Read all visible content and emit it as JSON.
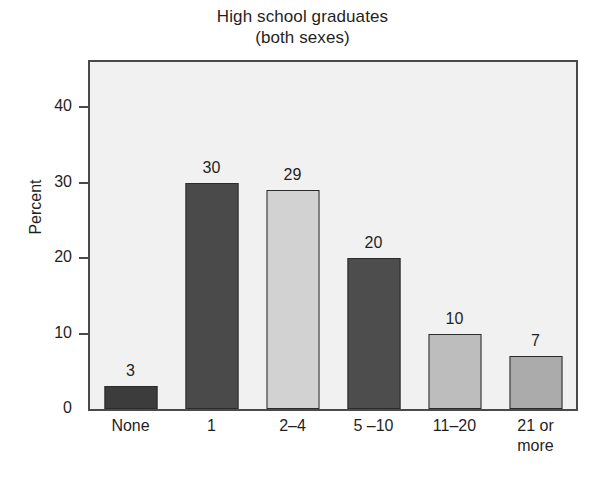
{
  "chart_data": {
    "type": "bar",
    "title": "High school graduates",
    "subtitle": "(both sexes)",
    "title_lines": [
      "High school graduates",
      "(both sexes)"
    ],
    "xlabel": "",
    "ylabel": "Percent",
    "categories": [
      "None",
      "1",
      "2–4",
      "5 –10",
      "11–20",
      "21 or\nmore"
    ],
    "category_lines": [
      [
        "None"
      ],
      [
        "1"
      ],
      [
        "2–4"
      ],
      [
        "5 –10"
      ],
      [
        "11–20"
      ],
      [
        "21 or",
        "more"
      ]
    ],
    "values": [
      3,
      30,
      29,
      20,
      10,
      7
    ],
    "value_labels": [
      "3",
      "30",
      "29",
      "20",
      "10",
      "7"
    ],
    "bar_colors": [
      "#3c3c3c",
      "#4a4a4a",
      "#d2d2d2",
      "#4d4d4d",
      "#bdbdbd",
      "#ababab"
    ],
    "bar_border_color": "#2b2b2b",
    "ylim": [
      0,
      46
    ],
    "yticks": [
      0,
      10,
      20,
      30,
      40
    ],
    "ytick_labels": [
      "0",
      "10",
      "20",
      "30",
      "40"
    ],
    "grid": false,
    "legend": false,
    "plot_background": "#f1f1f1",
    "axis_color": "#4a4a4a"
  }
}
